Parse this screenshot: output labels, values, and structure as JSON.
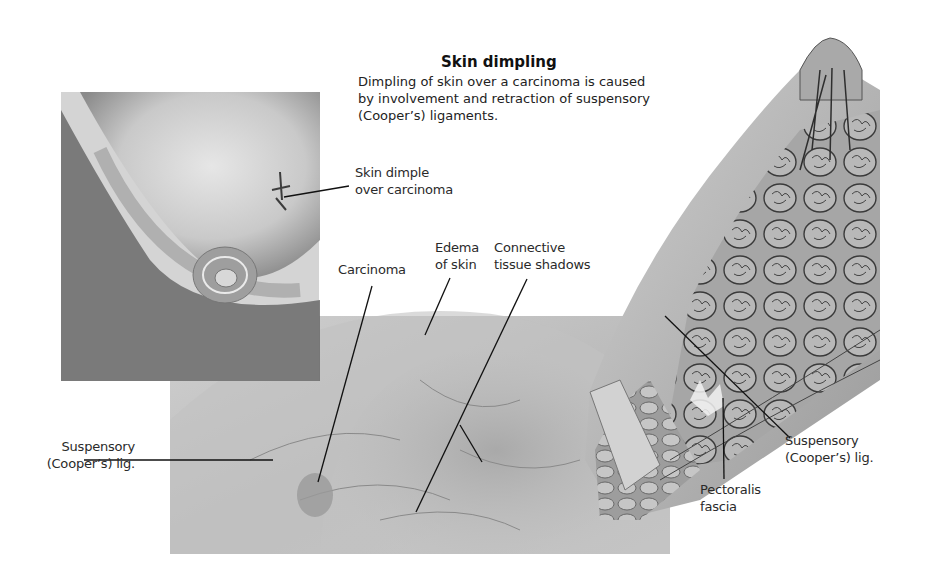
{
  "header": {
    "title": "Skin dimpling",
    "description": "Dimpling of skin over a carcinoma is caused by involvement and retraction of suspensory (Cooper’s) ligaments."
  },
  "labels": {
    "skin_dimple": {
      "line1": "Skin dimple",
      "line2": "over carcinoma"
    },
    "carcinoma": "Carcinoma",
    "edema": {
      "line1": "Edema",
      "line2": "of skin"
    },
    "connective": {
      "line1": "Connective",
      "line2": "tissue shadows"
    },
    "suspensory_left": {
      "line1": "Suspensory",
      "line2": "(Cooper’s) lig."
    },
    "suspensory_right": {
      "line1": "Suspensory",
      "line2": "(Cooper’s) lig."
    },
    "pectoralis": {
      "line1": "Pectoralis",
      "line2": "fascia"
    }
  },
  "panels": {
    "external_view": "breast-external-view-illustration",
    "mammogram": "mammogram-image",
    "cross_section": "breast-cross-section-illustration"
  },
  "colors": {
    "background": "#ffffff",
    "text": "#222222",
    "leader_line": "#111111",
    "tissue_light": "#d8d8d8",
    "tissue_mid": "#a8a8a8",
    "tissue_dark": "#555555"
  }
}
